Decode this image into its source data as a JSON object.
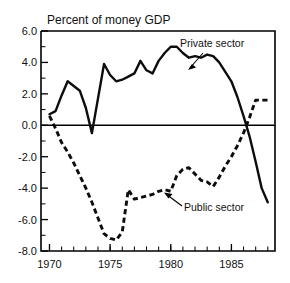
{
  "chart_data": {
    "type": "line",
    "title": "Percent of money GDP",
    "xlabel": "",
    "ylabel": "",
    "xlim": [
      1969.3,
      1988.6
    ],
    "ylim": [
      -8.0,
      6.0
    ],
    "grid": false,
    "legend_position": "inline-annotations",
    "y_ticks": [
      "6.0",
      "4.0",
      "2.0",
      "0.0",
      "-2.0",
      "-4.0",
      "-6.0",
      "-8.0"
    ],
    "y_tick_values": [
      6.0,
      4.0,
      2.0,
      0.0,
      -2.0,
      -4.0,
      -6.0,
      -8.0
    ],
    "y_minor_step": 1.0,
    "x_ticks": [
      "1970",
      "1975",
      "1980",
      "1985"
    ],
    "x_tick_values": [
      1970,
      1975,
      1980,
      1985
    ],
    "x_minor_step": 1,
    "zero_reference_line": 0.0,
    "series": [
      {
        "name": "Private sector",
        "style": "solid",
        "x": [
          1970,
          1970.5,
          1971,
          1971.5,
          1972,
          1972.5,
          1973,
          1973.5,
          1974.5,
          1975,
          1975.5,
          1976,
          1976.5,
          1977,
          1977.5,
          1978,
          1978.5,
          1979,
          1979.5,
          1980,
          1980.5,
          1981,
          1981.5,
          1982,
          1982.5,
          1983,
          1983.5,
          1984,
          1984.5,
          1985,
          1985.5,
          1986,
          1986.5,
          1987,
          1987.5,
          1988
        ],
        "values": [
          0.7,
          0.9,
          1.9,
          2.8,
          2.5,
          2.2,
          1.1,
          -0.5,
          3.9,
          3.2,
          2.8,
          2.9,
          3.1,
          3.3,
          4.1,
          3.5,
          3.3,
          4.1,
          4.6,
          5.0,
          5.0,
          4.6,
          4.3,
          4.4,
          4.3,
          4.5,
          4.4,
          4.0,
          3.4,
          2.8,
          1.8,
          0.6,
          -0.7,
          -2.3,
          -4.0,
          -4.9
        ]
      },
      {
        "name": "Public sector",
        "style": "dashed",
        "x": [
          1970,
          1970.5,
          1971,
          1971.5,
          1972,
          1972.5,
          1973,
          1973.5,
          1974,
          1974.5,
          1975,
          1975.5,
          1976,
          1976.5,
          1977,
          1977.5,
          1978,
          1978.5,
          1979,
          1979.5,
          1980,
          1980.5,
          1981,
          1981.5,
          1982,
          1982.5,
          1983,
          1983.5,
          1984,
          1984.5,
          1985,
          1985.5,
          1986,
          1986.5,
          1987,
          1987.5,
          1988
        ],
        "values": [
          0.6,
          -0.2,
          -1.1,
          -1.7,
          -2.4,
          -3.2,
          -4.0,
          -4.9,
          -5.9,
          -6.9,
          -7.2,
          -7.3,
          -6.8,
          -4.1,
          -4.7,
          -4.6,
          -4.5,
          -4.4,
          -4.2,
          -4.1,
          -4.2,
          -3.2,
          -2.8,
          -2.7,
          -3.1,
          -3.5,
          -3.6,
          -3.9,
          -3.3,
          -2.6,
          -2.0,
          -1.3,
          -0.5,
          0.5,
          1.6,
          1.6,
          1.6
        ]
      }
    ],
    "annotations": [
      {
        "label": "Private sector",
        "text_x": 180,
        "text_y": 47,
        "arrow_from": [
          186,
          52
        ],
        "arrow_to": [
          204,
          70
        ]
      },
      {
        "label": "Public sector",
        "text_x": 183,
        "text_y": 210,
        "arrow_from": [
          180,
          206
        ],
        "arrow_to": [
          158,
          193
        ]
      }
    ]
  },
  "figure": {
    "title": "Percent of money GDP",
    "background_color": "#ffffff",
    "line_color": "#0d0d0d",
    "text_color": "#111111"
  }
}
